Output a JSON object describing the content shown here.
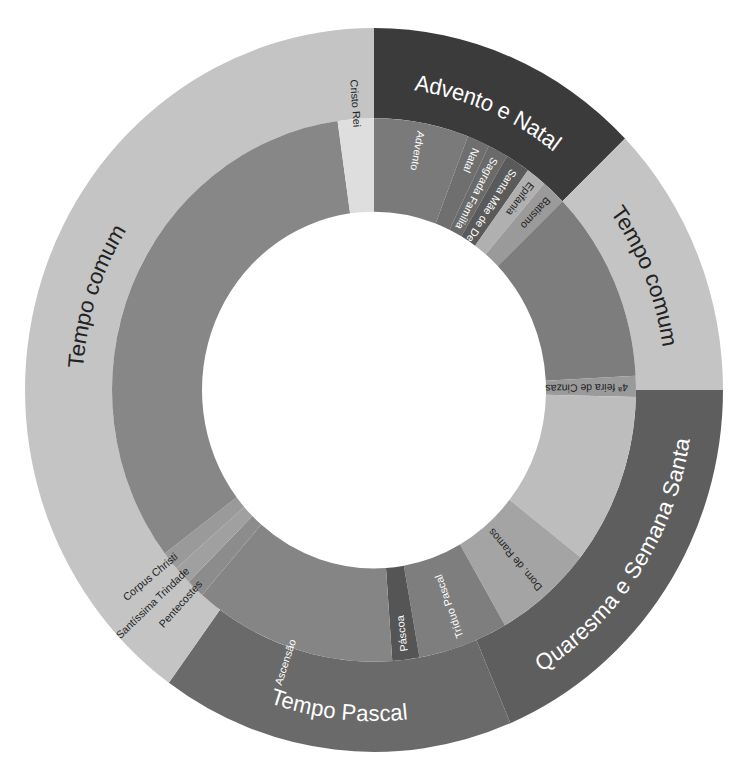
{
  "center": {
    "x": 374,
    "y": 390
  },
  "scale_y": 1.037,
  "radii": {
    "hole": 172,
    "inner_outer": 262,
    "outer_outer": 349
  },
  "outer_ring": [
    {
      "label": "Advento e Natal",
      "start": 0,
      "end": 46,
      "color": "#3b3b3b",
      "text_color": "#ffffff"
    },
    {
      "label": "Tempo comum",
      "start": 46,
      "end": 90,
      "color": "#c4c4c4",
      "text_color": "#222222"
    },
    {
      "label": "Quaresma e Semana Santa",
      "start": 90,
      "end": 157,
      "color": "#5e5e5e",
      "text_color": "#ffffff"
    },
    {
      "label": "Tempo Pascal",
      "start": 157,
      "end": 216,
      "color": "#6a6a6a",
      "text_color": "#ffffff"
    },
    {
      "label": "Tempo comum",
      "start": 216,
      "end": 360,
      "color": "#c4c4c4",
      "text_color": "#222222"
    }
  ],
  "inner_ring": [
    {
      "label": "Advento",
      "start": 0,
      "end": 21,
      "color": "#7a7a7a",
      "text_color": "#ffffff"
    },
    {
      "label": "Natal",
      "start": 21,
      "end": 26,
      "color": "#6f6f6f",
      "text_color": "#ffffff"
    },
    {
      "label": "Sagrada Família",
      "start": 26,
      "end": 30.5,
      "color": "#6a6a6a",
      "text_color": "#ffffff"
    },
    {
      "label": "Santa Mãe de Deus",
      "start": 30.5,
      "end": 36,
      "color": "#5a5a5a",
      "text_color": "#ffffff"
    },
    {
      "label": "Epifania",
      "start": 36,
      "end": 40.5,
      "color": "#b0b0b0",
      "text_color": "#222222"
    },
    {
      "label": "Batismo",
      "start": 40.5,
      "end": 46,
      "color": "#9a9a9a",
      "text_color": "#222222"
    },
    {
      "label": "",
      "start": 46,
      "end": 87,
      "color": "#7d7d7d",
      "text_color": "#ffffff"
    },
    {
      "label": "4ª feira de Cinzas",
      "start": 87,
      "end": 91.5,
      "color": "#9a9a9a",
      "text_color": "#222222"
    },
    {
      "label": "",
      "start": 91.5,
      "end": 128,
      "color": "#bdbdbd",
      "text_color": "#222222"
    },
    {
      "label": "Dom. de Ramos",
      "start": 128,
      "end": 150,
      "color": "#a4a4a4",
      "text_color": "#222222"
    },
    {
      "label": "Tríduo Pascal",
      "start": 150,
      "end": 170,
      "color": "#7e7e7e",
      "text_color": "#ffffff"
    },
    {
      "label": "Páscoa",
      "start": 170,
      "end": 176,
      "color": "#555555",
      "text_color": "#ffffff"
    },
    {
      "label": "Ascensão",
      "start": 176,
      "end": 221,
      "color": "#858585",
      "text_color": "#ffffff"
    },
    {
      "label": "Pentecostes",
      "start": 221,
      "end": 225,
      "color": "#8c8c8c",
      "text_color": "#222222"
    },
    {
      "label": "Santíssima Trindade",
      "start": 225,
      "end": 229,
      "color": "#a0a0a0",
      "text_color": "#222222"
    },
    {
      "label": "Corpus Christi",
      "start": 229,
      "end": 233,
      "color": "#9a9a9a",
      "text_color": "#222222"
    },
    {
      "label": "",
      "start": 233,
      "end": 352,
      "color": "#878787",
      "text_color": "#ffffff"
    },
    {
      "label": "Cristo Rei",
      "start": 352,
      "end": 360,
      "color": "#dedede",
      "text_color": "#222222"
    }
  ]
}
